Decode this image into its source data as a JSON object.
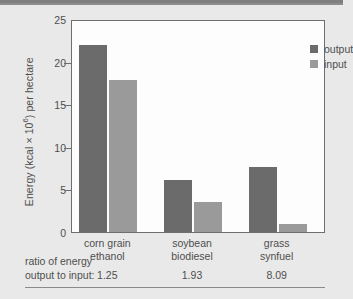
{
  "chart_data": {
    "type": "bar",
    "title": "",
    "subtitle": "",
    "xlabel": "",
    "ylabel": "Energy (kcal × 10⁶) per hectare",
    "ylabel_parts": {
      "pre": "Energy (kcal × 10",
      "sup": "6",
      "post": ") per hectare"
    },
    "ylim": [
      0,
      25
    ],
    "yticks": [
      0,
      5,
      10,
      15,
      20,
      25
    ],
    "ytick_labels": [
      "0",
      "5",
      "10",
      "15",
      "20",
      "25"
    ],
    "grid": false,
    "legend_position": "top-right",
    "categories": [
      "corn grain ethanol",
      "soybean biodiesel",
      "grass synfuel"
    ],
    "category_lines": [
      [
        "corn grain",
        "ethanol"
      ],
      [
        "soybean",
        "biodiesel"
      ],
      [
        "grass",
        "synfuel"
      ]
    ],
    "series": [
      {
        "name": "output",
        "color": "#6b6b6b",
        "values": [
          21.9,
          6.1,
          7.6
        ]
      },
      {
        "name": "input",
        "color": "#9a9a9a",
        "values": [
          17.8,
          3.5,
          0.9
        ]
      }
    ],
    "annotations": {
      "ratio_caption_line1": "ratio of energy",
      "ratio_caption_line2": "output to input:",
      "ratio_values": [
        "1.25",
        "1.93",
        "8.09"
      ]
    }
  },
  "legend": {
    "items": [
      {
        "label": "output",
        "color": "#6b6b6b"
      },
      {
        "label": "input",
        "color": "#9a9a9a"
      }
    ]
  },
  "colors": {
    "background": "#e9e9e9",
    "plot_background": "#fdfdfd",
    "axis": "#6e6e6e",
    "text": "#4f4f4f",
    "top_band": "#8d8d8d",
    "output_bar": "#6b6b6b",
    "input_bar": "#9a9a9a"
  }
}
